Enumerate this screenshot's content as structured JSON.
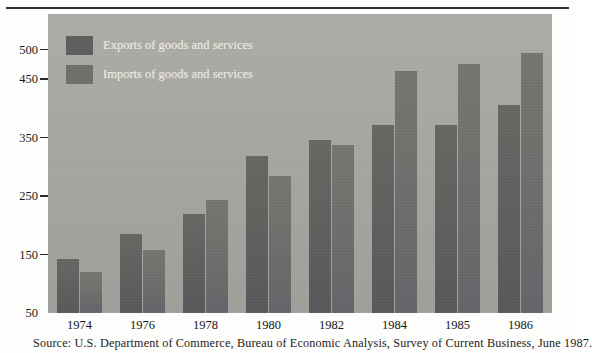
{
  "figure": {
    "source_note": "Source: U.S. Department of Commerce, Bureau of Economic Analysis, Survey of Current Business, June 1987."
  },
  "legend": {
    "position": "inside-top-left",
    "entries": [
      {
        "label": "Exports of goods and services",
        "color": "#5e5e5e"
      },
      {
        "label": "Imports of goods and services",
        "color": "#6f6f6c"
      }
    ]
  },
  "axis": {
    "y_ticks": [
      "500",
      "450",
      "350",
      "250",
      "150",
      "50"
    ],
    "x_ticks": [
      "1974",
      "1976",
      "1978",
      "1980",
      "1982",
      "1984",
      "1985",
      "1986"
    ]
  },
  "colors": {
    "panel": "#a9a9a4",
    "exports_bar": "#5e5e5e",
    "imports_bar": "#6f6f6c",
    "rule": "#2e2e2e",
    "text": "#1a1a1a",
    "legend_text": "#efefea"
  },
  "chart_data": {
    "type": "bar",
    "title": "",
    "subtitle": "",
    "xlabel": "",
    "ylabel": "",
    "categories": [
      "1974",
      "1976",
      "1978",
      "1980",
      "1982",
      "1984",
      "1985",
      "1986"
    ],
    "series": [
      {
        "name": "Exports of goods and services",
        "color": "#5e5e5e",
        "values": [
          142,
          185,
          220,
          318,
          345,
          372,
          372,
          406
        ]
      },
      {
        "name": "Imports of goods and services",
        "color": "#6f6f6c",
        "values": [
          120,
          157,
          243,
          285,
          338,
          463,
          475,
          495
        ]
      }
    ],
    "ylim": [
      50,
      520
    ],
    "y_tick_values": [
      500,
      450,
      350,
      250,
      150,
      50
    ],
    "grid": false,
    "legend_position": "top-left-inside",
    "units": "billions of dollars",
    "annotations": []
  }
}
